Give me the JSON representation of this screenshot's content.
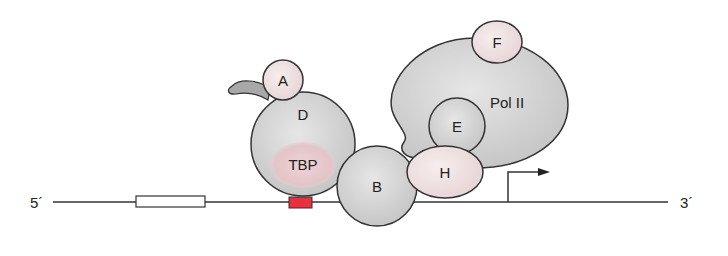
{
  "diagram": {
    "strand_labels": {
      "five_prime": "5´",
      "three_prime": "3´"
    },
    "factors": {
      "A": "A",
      "D": "D",
      "TBP": "TBP",
      "B": "B",
      "H": "H",
      "E": "E",
      "F": "F",
      "polII": "Pol II"
    },
    "elements": {
      "upstream_element": "white box",
      "tata_box": "red box",
      "transcription_start": "arrow"
    },
    "colors": {
      "grey_protein": "#d4d4d4",
      "pink_protein": "#efdede",
      "tbp_pink": "#e8c8cc",
      "tata_red": "#e8313f",
      "outline": "#333333",
      "dna": "#333333"
    }
  }
}
